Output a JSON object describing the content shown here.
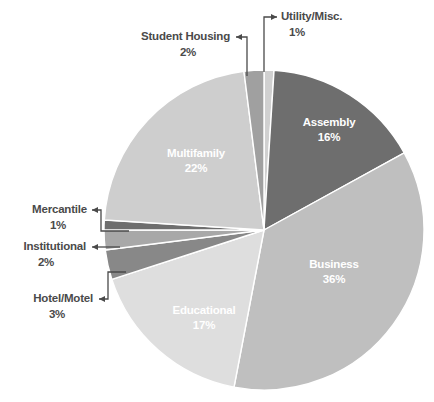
{
  "chart_data": {
    "type": "pie",
    "title": "",
    "subtitle": "",
    "xlabel": "",
    "ylabel": "",
    "legend_position": "none",
    "grid": false,
    "units": "percent",
    "start_angle_deg": -90,
    "direction": "clockwise",
    "categories": [
      "Utility/Misc.",
      "Assembly",
      "Business",
      "Educational",
      "Hotel/Motel",
      "Institutional",
      "Mercantile",
      "Multifamily",
      "Student Housing"
    ],
    "values": [
      1,
      16,
      36,
      17,
      3,
      2,
      1,
      22,
      2
    ],
    "slices": [
      {
        "label": "Utility/Misc.",
        "value": 1,
        "value_text": "1%",
        "color": "#d0d0d0",
        "label_placement": "callout",
        "text_color": "#4a4a4a"
      },
      {
        "label": "Assembly",
        "value": 16,
        "value_text": "16%",
        "color": "#6e6e6e",
        "label_placement": "inside",
        "text_color": "#ffffff"
      },
      {
        "label": "Business",
        "value": 36,
        "value_text": "36%",
        "color": "#bfbfbf",
        "label_placement": "inside",
        "text_color": "#ffffff"
      },
      {
        "label": "Educational",
        "value": 17,
        "value_text": "17%",
        "color": "#dedede",
        "label_placement": "inside",
        "text_color": "#ffffff"
      },
      {
        "label": "Hotel/Motel",
        "value": 3,
        "value_text": "3%",
        "color": "#888888",
        "label_placement": "callout",
        "text_color": "#4a4a4a"
      },
      {
        "label": "Institutional",
        "value": 2,
        "value_text": "2%",
        "color": "#a8a8a8",
        "label_placement": "callout",
        "text_color": "#4a4a4a"
      },
      {
        "label": "Mercantile",
        "value": 1,
        "value_text": "1%",
        "color": "#6e6e6e",
        "label_placement": "callout",
        "text_color": "#4a4a4a"
      },
      {
        "label": "Multifamily",
        "value": 22,
        "value_text": "22%",
        "color": "#cecece",
        "label_placement": "inside",
        "text_color": "#ffffff"
      },
      {
        "label": "Student Housing",
        "value": 2,
        "value_text": "2%",
        "color": "#a0a0a0",
        "label_placement": "callout",
        "text_color": "#4a4a4a"
      }
    ],
    "geometry": {
      "center_x": 264,
      "center_y": 230,
      "radius": 160
    },
    "inside_labels": [
      {
        "label": "Assembly",
        "value_text": "16%",
        "x": 329,
        "y": 126,
        "anchor": "middle"
      },
      {
        "label": "Business",
        "value_text": "36%",
        "x": 334,
        "y": 268,
        "anchor": "middle"
      },
      {
        "label": "Educational",
        "value_text": "17%",
        "x": 204,
        "y": 314,
        "anchor": "middle"
      },
      {
        "label": "Multifamily",
        "value_text": "22%",
        "x": 196,
        "y": 157,
        "anchor": "middle"
      }
    ],
    "callouts": [
      {
        "label": "Utility/Misc.",
        "value_text": "1%",
        "text_x": 281,
        "text_y": 20,
        "value_x": 297,
        "value_y": 36,
        "anchor": "start",
        "arrow_dir": "right",
        "path": "M 264 72 L 264 17 L 277 17",
        "arrow": "M 277 17 L 271 14 L 271 20 Z"
      },
      {
        "label": "Student Housing",
        "value_text": "2%",
        "text_x": 230,
        "text_y": 40,
        "value_x": 188,
        "value_y": 56,
        "anchor": "end",
        "arrow_dir": "left",
        "path": "M 247 76 L 247 37 L 236 37",
        "arrow": "M 236 37 L 242 34 L 242 40 Z"
      },
      {
        "label": "Mercantile",
        "value_text": "1%",
        "text_x": 87,
        "text_y": 213,
        "value_x": 58,
        "value_y": 229,
        "anchor": "end",
        "arrow_dir": "left",
        "path": "M 129 231 L 101 231 L 101 210 L 92 210",
        "arrow": "M 92 210 L 98 207 L 98 213 Z"
      },
      {
        "label": "Institutional",
        "value_text": "2%",
        "text_x": 86,
        "text_y": 250,
        "value_x": 46,
        "value_y": 266,
        "anchor": "end",
        "arrow_dir": "left",
        "path": "M 120 247 L 92 247",
        "arrow": "M 92 247 L 98 244 L 98 250 Z"
      },
      {
        "label": "Hotel/Motel",
        "value_text": "3%",
        "text_x": 93,
        "text_y": 302,
        "value_x": 57,
        "value_y": 318,
        "anchor": "end",
        "arrow_dir": "left",
        "path": "M 126 272 L 108 272 L 108 299 L 99 299",
        "arrow": "M 99 299 L 105 296 L 105 302 Z"
      }
    ]
  }
}
